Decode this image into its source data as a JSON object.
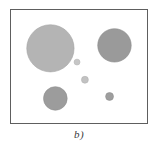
{
  "figure": {
    "caption": "b)",
    "panel_label": "b",
    "background_color": "#ffffff",
    "frame": {
      "border_color": "#5e5e5e",
      "fill_color": "#ffffff",
      "x": 10,
      "y": 9,
      "width": 138,
      "height": 115
    }
  },
  "chart_data": {
    "type": "scatter",
    "title": "b)",
    "xlabel": "",
    "ylabel": "",
    "xlim": [
      0,
      138
    ],
    "ylim": [
      0,
      115
    ],
    "grid": false,
    "legend": "none",
    "series": [
      {
        "name": "circles",
        "points": [
          {
            "id": "circle-large-upper-left",
            "cx": 50,
            "cy": 48,
            "r": 24,
            "color": "#b4b4b4",
            "stroke": "#a3a3a3",
            "size_rank": 1
          },
          {
            "id": "circle-medium-upper-right",
            "cx": 115,
            "cy": 45,
            "r": 17,
            "color": "#9a9a9a",
            "stroke": "#8c8c8c",
            "size_rank": 2
          },
          {
            "id": "circle-small-lower-left",
            "cx": 55,
            "cy": 99,
            "r": 12,
            "color": "#9c9c9c",
            "stroke": "#8e8e8e",
            "size_rank": 3
          },
          {
            "id": "dot-center-lower-right",
            "cx": 110,
            "cy": 97,
            "r": 4,
            "color": "#9e9e9e",
            "stroke": "#8f8f8f",
            "size_rank": 4
          },
          {
            "id": "dot-center-lower",
            "cx": 85,
            "cy": 80,
            "r": 3.5,
            "color": "#c2c2c2",
            "stroke": "#b0b0b0",
            "size_rank": 5
          },
          {
            "id": "dot-center-upper",
            "cx": 77,
            "cy": 62,
            "r": 3,
            "color": "#c6c6c6",
            "stroke": "#b4b4b4",
            "size_rank": 6
          }
        ]
      }
    ]
  }
}
